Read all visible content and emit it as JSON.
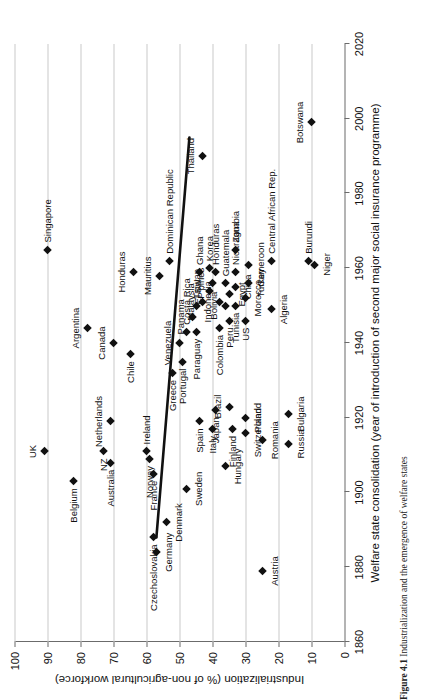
{
  "figure": {
    "caption_label": "Figure 4.1",
    "caption_text": "Industrialization and the emergence of welfare states"
  },
  "chart_data": {
    "type": "scatter",
    "title": "",
    "xlabel": "Welfare state consolidation (year of introduction of second major social insurance programme)",
    "ylabel": "Industrialization (% of non-agricultural workforce)",
    "xlim": [
      1860,
      2020
    ],
    "ylim": [
      0,
      100
    ],
    "xticks": [
      1860,
      1880,
      1900,
      1920,
      1940,
      1960,
      1980,
      2000,
      2020
    ],
    "yticks": [
      0,
      10,
      20,
      30,
      40,
      50,
      60,
      70,
      80,
      90,
      100
    ],
    "grid": "horizontal",
    "legend": "none",
    "trendline": {
      "x0": 1888,
      "y0": 57,
      "x1": 1995,
      "y1": 47,
      "style": "solid-thick-black"
    },
    "points": [
      {
        "name": "Singapore",
        "x": 1965,
        "y": 90,
        "lp": "r"
      },
      {
        "name": "UK",
        "x": 1911,
        "y": 91,
        "lp": "t"
      },
      {
        "name": "Belgium",
        "x": 1903,
        "y": 82,
        "lp": "l"
      },
      {
        "name": "Argentina",
        "x": 1944,
        "y": 78,
        "lp": "t"
      },
      {
        "name": "NZ",
        "x": 1911,
        "y": 73,
        "lp": "l"
      },
      {
        "name": "Netherlands",
        "x": 1919,
        "y": 71,
        "lp": "t"
      },
      {
        "name": "Canada",
        "x": 1940,
        "y": 70,
        "lp": "t"
      },
      {
        "name": "Australia",
        "x": 1908,
        "y": 71,
        "lp": "l"
      },
      {
        "name": "Chile",
        "x": 1937,
        "y": 65,
        "lp": "l"
      },
      {
        "name": "Honduras",
        "x": 1959,
        "y": 64,
        "lp": "t"
      },
      {
        "name": "Norway",
        "x": 1909,
        "y": 59,
        "lp": "l"
      },
      {
        "name": "France",
        "x": 1905,
        "y": 58,
        "lp": "l"
      },
      {
        "name": "Ireland",
        "x": 1911,
        "y": 60,
        "lp": "r"
      },
      {
        "name": "Czechoslovakia",
        "x": 1888,
        "y": 58,
        "lp": "l"
      },
      {
        "name": "Germany",
        "x": 1884,
        "y": 57,
        "lp": "b"
      },
      {
        "name": "Denmark",
        "x": 1892,
        "y": 54,
        "lp": "b"
      },
      {
        "name": "Greece",
        "x": 1932,
        "y": 52,
        "lp": "l"
      },
      {
        "name": "Mauritius",
        "x": 1958,
        "y": 56,
        "lp": "t"
      },
      {
        "name": "Dominican Republic",
        "x": 1962,
        "y": 53,
        "lp": "r"
      },
      {
        "name": "Portugal",
        "x": 1935,
        "y": 49,
        "lp": "l"
      },
      {
        "name": "Venezuela",
        "x": 1940,
        "y": 50,
        "lp": "t"
      },
      {
        "name": "Costa Rica",
        "x": 1943,
        "y": 48,
        "lp": "r"
      },
      {
        "name": "Sweden",
        "x": 1901,
        "y": 48,
        "lp": "b"
      },
      {
        "name": "Spain",
        "x": 1919,
        "y": 44,
        "lp": "l"
      },
      {
        "name": "Panama",
        "x": 1947,
        "y": 46,
        "lp": "t"
      },
      {
        "name": "Paraguay",
        "x": 1943,
        "y": 45,
        "lp": "l"
      },
      {
        "name": "Taiwan",
        "x": 1950,
        "y": 45,
        "lp": "r"
      },
      {
        "name": "Malaysia",
        "x": 1951,
        "y": 43,
        "lp": "t"
      },
      {
        "name": "Ghana",
        "x": 1959,
        "y": 44,
        "lp": "r"
      },
      {
        "name": "Korea",
        "x": 1960,
        "y": 41,
        "lp": "r"
      },
      {
        "name": "El Sal.",
        "x": 1954,
        "y": 41,
        "lp": "t"
      },
      {
        "name": "P'pines",
        "x": 1956,
        "y": 40,
        "lp": "t"
      },
      {
        "name": "Honduras2",
        "x": 1959,
        "y": 39,
        "lp": "r"
      },
      {
        "name": "Italy",
        "x": 1917,
        "y": 40,
        "lp": "l"
      },
      {
        "name": "Japan",
        "x": 1922,
        "y": 39,
        "lp": "l"
      },
      {
        "name": "Colombia",
        "x": 1944,
        "y": 38,
        "lp": "l"
      },
      {
        "name": "Indonesia",
        "x": 1951,
        "y": 38,
        "lp": "t"
      },
      {
        "name": "Bolivia",
        "x": 1950,
        "y": 36,
        "lp": "t"
      },
      {
        "name": "Egypt",
        "x": 1953,
        "y": 35,
        "lp": "b"
      },
      {
        "name": "Guatemala",
        "x": 1956,
        "y": 36,
        "lp": "r"
      },
      {
        "name": "Hungary",
        "x": 1907,
        "y": 36,
        "lp": "b"
      },
      {
        "name": "Finland",
        "x": 1917,
        "y": 34,
        "lp": "l"
      },
      {
        "name": "Brazil",
        "x": 1923,
        "y": 35,
        "lp": "t"
      },
      {
        "name": "Peru",
        "x": 1946,
        "y": 35,
        "lp": "l"
      },
      {
        "name": "Tunisia",
        "x": 1950,
        "y": 33,
        "lp": "l"
      },
      {
        "name": "China",
        "x": 1955,
        "y": 33,
        "lp": "b"
      },
      {
        "name": "Nicaragua",
        "x": 1959,
        "y": 33,
        "lp": "r"
      },
      {
        "name": "Zambia",
        "x": 1965,
        "y": 33,
        "lp": "r"
      },
      {
        "name": "Switzerland",
        "x": 1916,
        "y": 30,
        "lp": "b"
      },
      {
        "name": "Poland",
        "x": 1920,
        "y": 30,
        "lp": "b"
      },
      {
        "name": "US",
        "x": 1946,
        "y": 30,
        "lp": "l"
      },
      {
        "name": "Morocco",
        "x": 1952,
        "y": 30,
        "lp": "b"
      },
      {
        "name": "Turkey",
        "x": 1956,
        "y": 29,
        "lp": "b"
      },
      {
        "name": "Cameroon",
        "x": 1961,
        "y": 29,
        "lp": "b"
      },
      {
        "name": "Romania",
        "x": 1914,
        "y": 25,
        "lp": "b"
      },
      {
        "name": "Austria",
        "x": 1879,
        "y": 25,
        "lp": "b"
      },
      {
        "name": "Algeria",
        "x": 1949,
        "y": 22,
        "lp": "b"
      },
      {
        "name": "Central African Rep.",
        "x": 1962,
        "y": 22,
        "lp": "r"
      },
      {
        "name": "Russia",
        "x": 1913,
        "y": 17,
        "lp": "b"
      },
      {
        "name": "Bulgaria",
        "x": 1921,
        "y": 17,
        "lp": "b"
      },
      {
        "name": "Burundi",
        "x": 1962,
        "y": 11,
        "lp": "r"
      },
      {
        "name": "Niger",
        "x": 1961,
        "y": 9,
        "lp": "b"
      },
      {
        "name": "Thailand",
        "x": 1990,
        "y": 43,
        "lp": "t"
      },
      {
        "name": "Botswana",
        "x": 1999,
        "y": 10,
        "lp": "t"
      }
    ]
  }
}
